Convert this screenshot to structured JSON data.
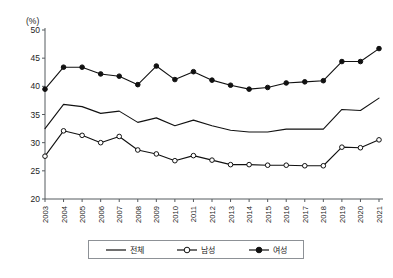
{
  "chart_data": {
    "type": "line",
    "title": "",
    "xlabel": "",
    "ylabel": "",
    "y_unit_label": "(%)",
    "grid": false,
    "legend_position": "bottom",
    "ylim": [
      20,
      50
    ],
    "y_ticks": [
      20,
      25,
      30,
      35,
      40,
      45,
      50
    ],
    "categories": [
      "2003",
      "2004",
      "2005",
      "2006",
      "2007",
      "2008",
      "2009",
      "2010",
      "2011",
      "2012",
      "2013",
      "2014",
      "2015",
      "2016",
      "2017",
      "2018",
      "2019",
      "2020",
      "2021"
    ],
    "series": [
      {
        "name": "전체",
        "marker": "none",
        "values": [
          32.5,
          36.8,
          36.4,
          35.2,
          35.6,
          33.6,
          34.4,
          33.0,
          34.0,
          33.0,
          32.2,
          31.9,
          31.9,
          32.4,
          32.4,
          32.4,
          35.9,
          35.7,
          37.9
        ]
      },
      {
        "name": "남성",
        "marker": "open-circle",
        "values": [
          27.6,
          32.1,
          31.3,
          30.0,
          31.1,
          28.7,
          28.0,
          26.8,
          27.7,
          26.9,
          26.1,
          26.1,
          26.0,
          26.0,
          25.9,
          25.9,
          29.2,
          29.1,
          30.5
        ]
      },
      {
        "name": "여성",
        "marker": "filled-circle",
        "values": [
          39.5,
          43.4,
          43.4,
          42.2,
          41.8,
          40.3,
          43.6,
          41.2,
          42.6,
          41.1,
          40.2,
          39.5,
          39.8,
          40.6,
          40.8,
          41.0,
          44.4,
          44.4,
          46.7
        ]
      }
    ]
  },
  "legend": {
    "items": [
      {
        "label": "전체",
        "marker": "none"
      },
      {
        "label": "남성",
        "marker": "open-circle"
      },
      {
        "label": "여성",
        "marker": "filled-circle"
      }
    ]
  }
}
